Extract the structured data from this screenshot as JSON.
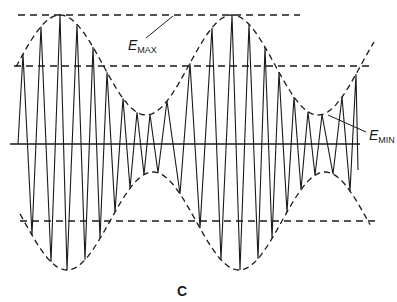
{
  "figure": {
    "panel_label": "C",
    "labels": {
      "emax": {
        "main": "E",
        "sub": "MAX"
      },
      "emin": {
        "main": "E",
        "sub": "MIN"
      }
    },
    "colors": {
      "stroke": "#1a1a1a",
      "background": "#ffffff"
    }
  },
  "chart_data": {
    "type": "line",
    "title": "",
    "annotations": [
      "E_MAX",
      "E_MIN",
      "C"
    ],
    "axis": {
      "y_baseline": 144,
      "x_range": [
        10,
        360
      ]
    },
    "reference_lines": {
      "emax_upper_y": 15,
      "emin_upper_y": 66,
      "emin_lower_y": 221
    },
    "envelope": {
      "upper_maxima_x": [
        60,
        232
      ],
      "upper_minima_x": [
        150,
        323
      ],
      "upper_max_y": 15,
      "upper_min_y": 115,
      "lower_max_y": 270,
      "lower_min_y": 172
    },
    "carrier_peaks": {
      "up_x": [
        23,
        41,
        60,
        77,
        93,
        107,
        123,
        137,
        150,
        167,
        190,
        212,
        232,
        249,
        265,
        279,
        294,
        308,
        322,
        342,
        356
      ],
      "down_x": [
        32,
        51,
        67,
        85,
        100,
        115,
        130,
        144,
        158,
        180,
        200,
        221,
        240,
        258,
        272,
        287,
        301,
        315,
        333,
        350
      ]
    }
  }
}
